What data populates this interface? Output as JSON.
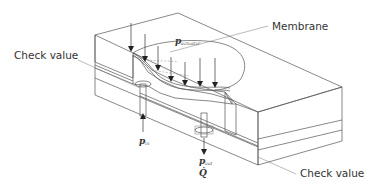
{
  "diagram": {
    "type": "isometric cross-section of micropump",
    "labels": {
      "membrane": "Membrane",
      "check_valve_inlet": "Check value",
      "check_valve_outlet": "Check value",
      "p_actuator": "p",
      "p_actuator_sub": "actuator",
      "p_in": "p",
      "p_in_sub": "in",
      "p_out": "p",
      "p_out_sub": "out",
      "q_dot": "Q̇"
    },
    "colors": {
      "line": "#555555",
      "text": "#333333",
      "background": "#ffffff"
    },
    "actuator_arrow_count": 9
  }
}
